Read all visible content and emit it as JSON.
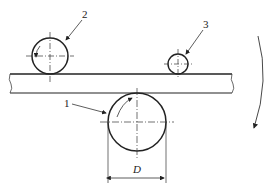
{
  "diagram": {
    "labels": {
      "roller_1": "1",
      "roller_2": "2",
      "roller_3": "3",
      "dimension": "D"
    },
    "colors": {
      "line": "#222222",
      "background": "#ffffff"
    }
  }
}
